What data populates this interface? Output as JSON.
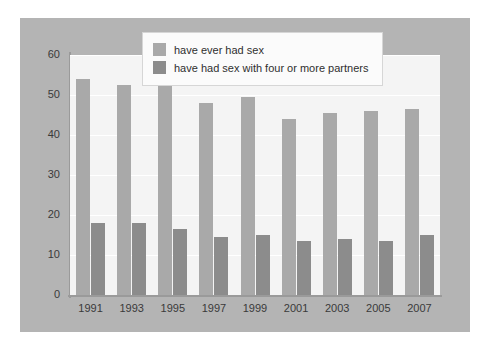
{
  "chart_data": {
    "type": "bar",
    "title": "",
    "subtitle": "",
    "xlabel": "",
    "ylabel": "",
    "categories": [
      "1991",
      "1993",
      "1995",
      "1997",
      "1999",
      "2001",
      "2003",
      "2005",
      "2007"
    ],
    "series": [
      {
        "name": "have ever had sex",
        "color": "#a9a9a9",
        "values": [
          54,
          52.5,
          52.5,
          48,
          49.5,
          44,
          45.5,
          46,
          46.5
        ]
      },
      {
        "name": "have had sex with four or more partners",
        "color": "#8c8c8c",
        "values": [
          18,
          18,
          16.5,
          14.5,
          15,
          13.5,
          14,
          13.5,
          15
        ]
      }
    ],
    "ylim": [
      0,
      60
    ],
    "ytick_values": [
      0,
      10,
      20,
      30,
      40,
      50,
      60
    ],
    "ytick_labels": [
      "0",
      "10",
      "20",
      "30",
      "40",
      "50",
      "60"
    ],
    "grid": "horizontal",
    "legend_position": "top-center"
  },
  "legend": {
    "items": [
      {
        "label": "have ever had sex",
        "color": "#a9a9a9"
      },
      {
        "label": "have had sex with four or more partners",
        "color": "#8c8c8c"
      }
    ]
  },
  "colors": {
    "panel_background": "#b4b4b4",
    "plot_background": "#f4f4f4",
    "gridline": "#ffffff",
    "axis": "#9a9a9a",
    "tick_text": "#3a3a3a",
    "series_light": "#a9a9a9",
    "series_dark": "#8c8c8c",
    "legend_background": "#fbfbfb",
    "legend_border": "#d6d6d6"
  }
}
